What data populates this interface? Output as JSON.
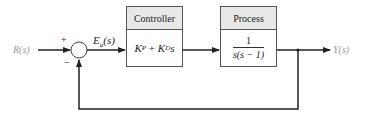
{
  "diagram": {
    "type": "feedback-block-diagram",
    "input": {
      "label": "R(s)"
    },
    "summing_junction": {
      "plus_sign": "+",
      "minus_sign": "−"
    },
    "error_signal": {
      "label_main": "E",
      "label_sub": "a",
      "label_tail": "(s)"
    },
    "controller": {
      "title": "Controller",
      "kp_main": "K",
      "kp_sub": "P",
      "plus": " + ",
      "kd_main": "K",
      "kd_sub": "D",
      "kd_tail": "s"
    },
    "process": {
      "title": "Process",
      "numerator": "1",
      "denominator": "s(s − 1)"
    },
    "output": {
      "label": "Y(s)"
    },
    "feedback": {
      "type": "unity",
      "sign": "negative"
    },
    "colors": {
      "line": "#222222",
      "block_header": "#e8e8e8",
      "io_label": "#9a9a9a"
    }
  }
}
